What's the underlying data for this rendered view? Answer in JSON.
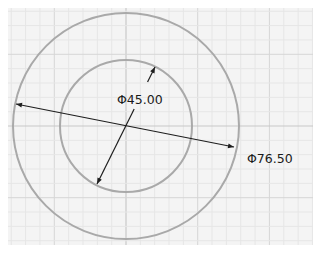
{
  "sketch": {
    "background": "#ffffff",
    "grid": {
      "area": {
        "x": 8,
        "y": 8,
        "width": 305,
        "height": 237
      },
      "fill": "#f4f4f4",
      "minor_color": "#e6e6e6",
      "major_color": "#d6d6d6",
      "axis_color": "#c8c8c8",
      "major_spacing": 71.7,
      "minor_divisions": 5,
      "origin": {
        "x": 126,
        "y": 126
      }
    },
    "circles": [
      {
        "name": "outer",
        "cx": 126,
        "cy": 126,
        "r": 113,
        "stroke": "#a9a9a9"
      },
      {
        "name": "inner",
        "cx": 126,
        "cy": 126,
        "r": 66,
        "stroke": "#a9a9a9"
      }
    ],
    "dimensions": [
      {
        "name": "outer-diameter",
        "label": "Φ76.50",
        "line": {
          "x1": 16,
          "y1": 104,
          "x2": 234,
          "y2": 147
        },
        "text_pos": {
          "x": 247,
          "y": 163
        }
      },
      {
        "name": "inner-diameter",
        "label": "Φ45.00",
        "line": {
          "x1": 155,
          "y1": 67,
          "x2": 97,
          "y2": 184
        },
        "gap": {
          "y_top": 82,
          "y_bottom": 109
        },
        "text_pos": {
          "x": 117,
          "y": 104
        }
      }
    ],
    "line_color": "#1e1e1e"
  }
}
